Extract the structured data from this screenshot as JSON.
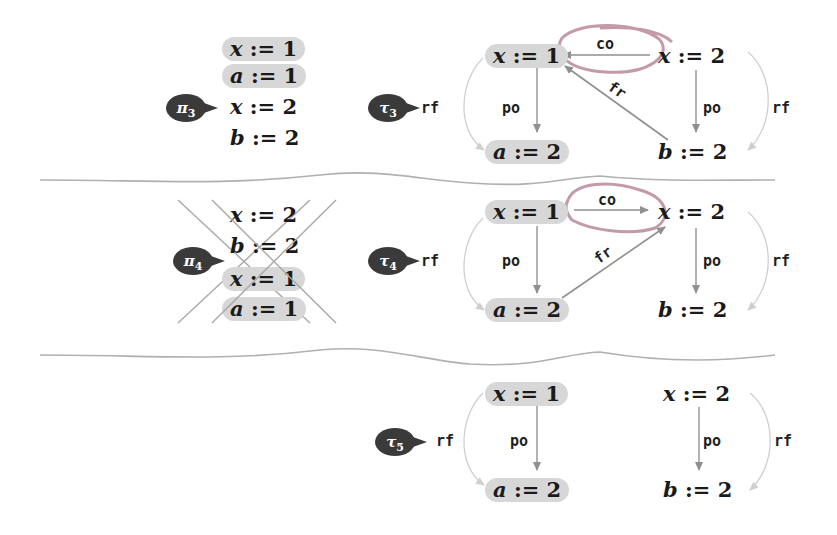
{
  "rows": [
    {
      "bubble": {
        "symbol": "π",
        "sub": "3"
      },
      "program": [
        {
          "var": "x",
          "op": ":=",
          "val": "1",
          "highlighted": true
        },
        {
          "var": "a",
          "op": ":=",
          "val": "1",
          "highlighted": true
        },
        {
          "var": "x",
          "op": ":=",
          "val": "2",
          "highlighted": false
        },
        {
          "var": "b",
          "op": ":=",
          "val": "2",
          "highlighted": false
        }
      ],
      "crossed_out": false,
      "trace_bubble": {
        "symbol": "τ",
        "sub": "3"
      },
      "trace": {
        "left_top": {
          "var": "x",
          "op": ":=",
          "val": "1",
          "highlighted": true
        },
        "left_bottom": {
          "var": "a",
          "op": ":=",
          "val": "2",
          "highlighted": true
        },
        "right_top": {
          "var": "x",
          "op": ":=",
          "val": "2",
          "highlighted": false
        },
        "right_bottom": {
          "var": "b",
          "op": ":=",
          "val": "2",
          "highlighted": false
        },
        "edges": {
          "left_rf": "rf",
          "left_po": "po",
          "co": "co",
          "fr": "fr",
          "right_po": "po",
          "right_rf": "rf"
        },
        "co_direction": "right-to-left",
        "fr_from": "b := 2",
        "fr_to": "x := 1",
        "circled": "co"
      }
    },
    {
      "bubble": {
        "symbol": "π",
        "sub": "4"
      },
      "program": [
        {
          "var": "x",
          "op": ":=",
          "val": "2",
          "highlighted": false
        },
        {
          "var": "b",
          "op": ":=",
          "val": "2",
          "highlighted": false
        },
        {
          "var": "x",
          "op": ":=",
          "val": "1",
          "highlighted": true
        },
        {
          "var": "a",
          "op": ":=",
          "val": "1",
          "highlighted": true
        }
      ],
      "crossed_out": true,
      "trace_bubble": {
        "symbol": "τ",
        "sub": "4"
      },
      "trace": {
        "left_top": {
          "var": "x",
          "op": ":=",
          "val": "1",
          "highlighted": true
        },
        "left_bottom": {
          "var": "a",
          "op": ":=",
          "val": "2",
          "highlighted": true
        },
        "right_top": {
          "var": "x",
          "op": ":=",
          "val": "2",
          "highlighted": false
        },
        "right_bottom": {
          "var": "b",
          "op": ":=",
          "val": "2",
          "highlighted": false
        },
        "edges": {
          "left_rf": "rf",
          "left_po": "po",
          "co": "co",
          "fr": "fr",
          "right_po": "po",
          "right_rf": "rf"
        },
        "co_direction": "left-to-right",
        "fr_from": "a := 2",
        "fr_to": "x := 2",
        "circled": "co"
      }
    },
    {
      "trace_bubble": {
        "symbol": "τ",
        "sub": "5"
      },
      "trace": {
        "left_top": {
          "var": "x",
          "op": ":=",
          "val": "1",
          "highlighted": true
        },
        "left_bottom": {
          "var": "a",
          "op": ":=",
          "val": "2",
          "highlighted": true
        },
        "right_top": {
          "var": "x",
          "op": ":=",
          "val": "2",
          "highlighted": false
        },
        "right_bottom": {
          "var": "b",
          "op": ":=",
          "val": "2",
          "highlighted": false
        },
        "edges": {
          "left_rf": "rf",
          "left_po": "po",
          "right_po": "po",
          "right_rf": "rf"
        }
      }
    }
  ],
  "colors": {
    "highlight": "#d7d7d7",
    "arrow": "#9a9a9a",
    "rf_arrow": "#c8c8c8",
    "circle": "#b98a96",
    "bubble": "#3a3a3a",
    "separator": "#b0b0b0"
  }
}
